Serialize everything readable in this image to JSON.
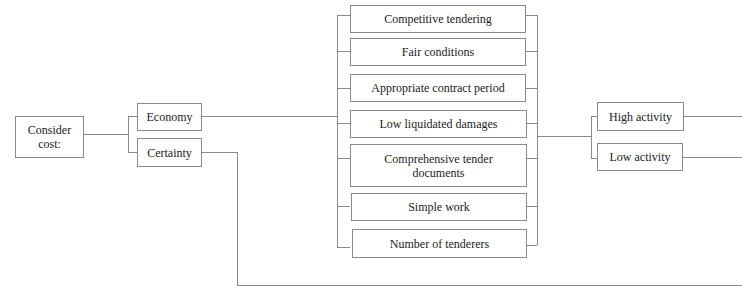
{
  "diagram": {
    "root": {
      "label": "Consider cost:"
    },
    "branches": [
      {
        "label": "Economy"
      },
      {
        "label": "Certainty"
      }
    ],
    "factors": [
      {
        "label": "Competitive tendering"
      },
      {
        "label": "Fair conditions"
      },
      {
        "label": "Appropriate contract period"
      },
      {
        "label": "Low liquidated damages"
      },
      {
        "label": "Comprehensive tender documents"
      },
      {
        "label": "Simple work"
      },
      {
        "label": "Number of tenderers"
      }
    ],
    "outcomes": [
      {
        "label": "High activity"
      },
      {
        "label": "Low activity"
      }
    ],
    "colors": {
      "line": "#8a8a8a",
      "text": "#222222",
      "background": "#ffffff"
    }
  }
}
